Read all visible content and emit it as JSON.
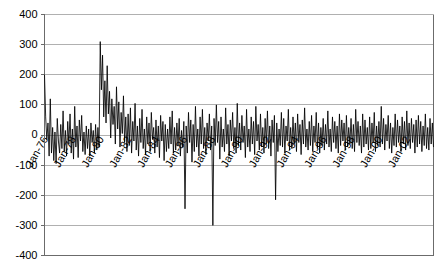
{
  "chart_data": {
    "type": "line",
    "title": "",
    "subtitle": "",
    "xlabel": "",
    "ylabel": "",
    "ylim": [
      -400,
      400
    ],
    "yticks": [
      400,
      300,
      200,
      100,
      0,
      -100,
      -200,
      -300,
      -400
    ],
    "ytick_labels": [
      "400",
      "300",
      "200",
      "100",
      "0",
      "-100",
      "-200",
      "-300",
      "-400"
    ],
    "grid": true,
    "legend": false,
    "legend_position": "none",
    "x_tick_labels": [
      "Jan-76",
      "Jan-78",
      "Jan-80",
      "Jan-82",
      "Jan-84",
      "Jan-86",
      "Jan-88",
      "Jan-90",
      "Jan-92",
      "Jan-94",
      "Jan-96",
      "Jan-98",
      "Jan-00",
      "Jan-02"
    ],
    "x_tick_interval_months": 24,
    "x_start": "Jan-76",
    "x_end": "Dec-02",
    "series_name": "monthly-value",
    "series_color": "#000000",
    "values": [
      200,
      60,
      -15,
      40,
      -70,
      120,
      -60,
      25,
      -85,
      10,
      -95,
      55,
      -20,
      -60,
      35,
      -45,
      80,
      -55,
      15,
      -70,
      45,
      -30,
      70,
      -60,
      20,
      -80,
      95,
      -40,
      30,
      -75,
      50,
      -20,
      65,
      -55,
      10,
      -65,
      30,
      -45,
      20,
      -70,
      40,
      -25,
      15,
      -60,
      35,
      -50,
      25,
      -40,
      310,
      150,
      265,
      60,
      180,
      40,
      230,
      70,
      145,
      -10,
      120,
      35,
      95,
      -30,
      160,
      20,
      110,
      -40,
      75,
      5,
      130,
      -25,
      60,
      -55,
      70,
      -35,
      90,
      -60,
      45,
      -20,
      105,
      -50,
      30,
      -70,
      55,
      -25,
      85,
      -45,
      20,
      -65,
      60,
      -30,
      40,
      -55,
      75,
      -15,
      25,
      -60,
      50,
      -40,
      30,
      -75,
      65,
      -20,
      45,
      -85,
      35,
      -55,
      20,
      -45,
      60,
      -30,
      80,
      -60,
      25,
      -50,
      40,
      -35,
      55,
      -70,
      15,
      -40,
      45,
      -245,
      30,
      -60,
      75,
      -25,
      50,
      -90,
      35,
      -55,
      95,
      -40,
      20,
      -70,
      60,
      -30,
      85,
      -45,
      25,
      -65,
      40,
      -20,
      70,
      -50,
      30,
      -300,
      55,
      -35,
      100,
      -25,
      45,
      -80,
      60,
      -40,
      20,
      -55,
      90,
      -30,
      35,
      -70,
      50,
      -20,
      75,
      -45,
      25,
      -60,
      105,
      -35,
      40,
      -50,
      65,
      -25,
      30,
      -75,
      85,
      -40,
      20,
      -55,
      60,
      -30,
      45,
      -65,
      95,
      -20,
      35,
      -50,
      70,
      -40,
      25,
      -60,
      55,
      -30,
      80,
      -45,
      30,
      -70,
      50,
      -25,
      65,
      -215,
      40,
      -55,
      20,
      -35,
      75,
      -40,
      55,
      -60,
      30,
      -20,
      85,
      -50,
      25,
      -45,
      60,
      -30,
      40,
      -55,
      70,
      -25,
      35,
      -65,
      50,
      -30,
      90,
      -40,
      20,
      -50,
      45,
      -35,
      65,
      -55,
      30,
      -25,
      75,
      -45,
      40,
      -60,
      25,
      -35,
      55,
      -50,
      35,
      -30,
      80,
      -40,
      20,
      -55,
      60,
      -25,
      45,
      -45,
      30,
      -60,
      70,
      -35,
      50,
      -20,
      40,
      -50,
      65,
      -40,
      25,
      -30,
      55,
      -45,
      35,
      -55,
      85,
      -25,
      45,
      -35,
      30,
      -60,
      70,
      -40,
      50,
      -30,
      25,
      -50,
      60,
      -45,
      40,
      -25,
      75,
      -55,
      30,
      -35,
      45,
      -40,
      95,
      -30,
      55,
      -50,
      35,
      -20,
      65,
      -45,
      40,
      -60,
      25,
      -35,
      70,
      -40,
      50,
      -25,
      30,
      -55,
      60,
      -30,
      45,
      -50,
      80,
      -35,
      40,
      -45,
      55,
      -25,
      35,
      -60,
      50,
      -40,
      65,
      -30,
      45,
      -55,
      30,
      -35,
      70,
      -45,
      25,
      -50,
      55,
      -30,
      40,
      -40
    ]
  }
}
